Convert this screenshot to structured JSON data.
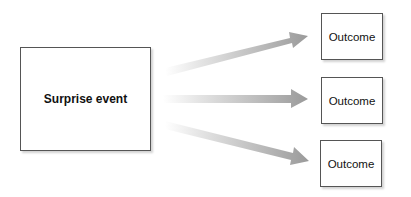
{
  "diagram": {
    "source": {
      "label": "Surprise event"
    },
    "outcomes": [
      {
        "label": "Outcome"
      },
      {
        "label": "Outcome"
      },
      {
        "label": "Outcome"
      }
    ],
    "colors": {
      "border": "#555555",
      "arrow_light": "#f2f2f2",
      "arrow_dark": "#999999"
    }
  }
}
